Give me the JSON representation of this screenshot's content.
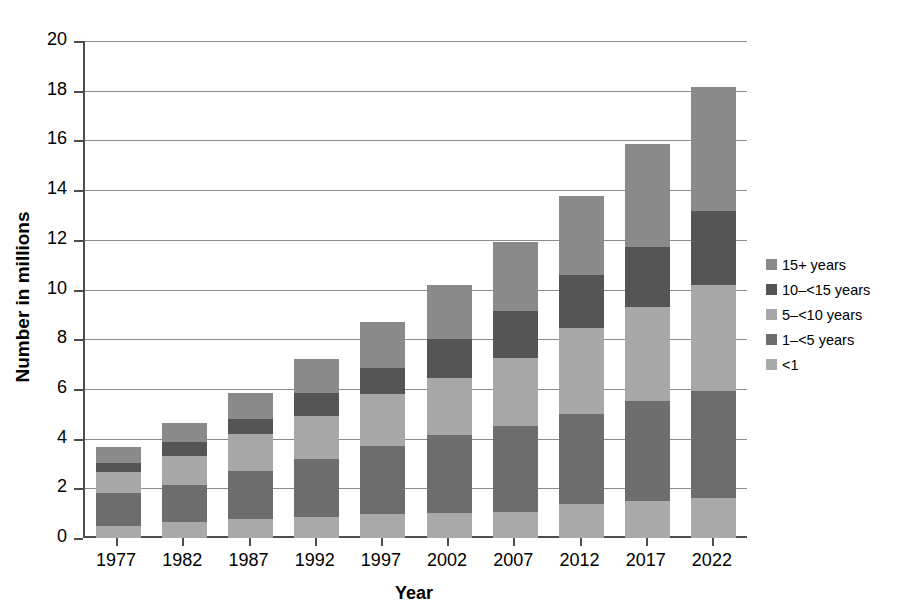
{
  "chart_data": {
    "type": "bar",
    "stacked": true,
    "title": "",
    "xlabel": "Year",
    "ylabel": "Number in millions",
    "categories": [
      "1977",
      "1982",
      "1987",
      "1992",
      "1997",
      "2002",
      "2007",
      "2012",
      "2017",
      "2022"
    ],
    "ylim": [
      0,
      20
    ],
    "ytick_labels": [
      "0",
      "2",
      "4",
      "6",
      "8",
      "10",
      "12",
      "14",
      "16",
      "18",
      "20"
    ],
    "ytick_values": [
      0,
      2,
      4,
      6,
      8,
      10,
      12,
      14,
      16,
      18,
      20
    ],
    "grid": true,
    "legend_position": "right",
    "series": [
      {
        "name": "<1",
        "color": "#aaaaaa",
        "values": [
          0.5,
          0.65,
          0.75,
          0.85,
          0.95,
          1.0,
          1.05,
          1.35,
          1.5,
          1.6
        ]
      },
      {
        "name": "1–<5 years",
        "color": "#6e6e6e",
        "values": [
          1.3,
          1.5,
          1.95,
          2.35,
          2.75,
          3.15,
          3.45,
          3.65,
          4.0,
          4.3
        ]
      },
      {
        "name": "5–<10 years",
        "color": "#a8a8a8",
        "values": [
          0.85,
          1.15,
          1.5,
          1.7,
          2.1,
          2.3,
          2.75,
          3.45,
          3.8,
          4.3
        ]
      },
      {
        "name": "10–<15 years",
        "color": "#555555",
        "values": [
          0.35,
          0.55,
          0.6,
          0.95,
          1.05,
          1.55,
          1.9,
          2.15,
          2.4,
          2.95
        ]
      },
      {
        "name": "15+ years",
        "color": "#8a8a8a",
        "values": [
          0.65,
          0.8,
          1.05,
          1.35,
          1.85,
          2.2,
          2.75,
          3.15,
          4.15,
          5.0
        ]
      }
    ],
    "totals": [
      3.65,
      4.65,
      5.85,
      7.2,
      8.7,
      10.2,
      11.9,
      13.8,
      15.85,
      18.1
    ]
  },
  "legend": {
    "items": [
      {
        "label": "15+ years",
        "color": "#8a8a8a"
      },
      {
        "label": "10–<15 years",
        "color": "#555555"
      },
      {
        "label": "5–<10 years",
        "color": "#a8a8a8"
      },
      {
        "label": "1–<5 years",
        "color": "#6e6e6e"
      },
      {
        "label": "<1",
        "color": "#aaaaaa"
      }
    ]
  },
  "axes": {
    "y_title": "Number in millions",
    "x_title": "Year"
  },
  "colors": {
    "gridline": "#8c8c8c",
    "axis": "#4d4d4d",
    "background": "#ffffff",
    "text": "#000000"
  }
}
